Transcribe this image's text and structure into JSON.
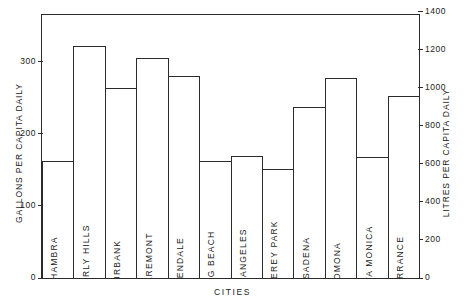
{
  "chart_data": {
    "type": "bar",
    "title": "",
    "xlabel": "CITIES",
    "ylabel": "GALLONS PER CAPITA DAILY",
    "ylabel_right": "LITRES PER CAPITA DAILY",
    "categories": [
      "ALHAMBRA",
      "BEVERLY HILLS",
      "BURBANK",
      "CLAREMONT",
      "GLENDALE",
      "LONG BEACH",
      "LOS ANGELES",
      "MONTEREY PARK",
      "PASADENA",
      "POMONA",
      "SANTA MONICA",
      "TORRANCE"
    ],
    "values": [
      162,
      322,
      264,
      305,
      281,
      162,
      169,
      151,
      238,
      278,
      168,
      252
    ],
    "values_litres": [
      613,
      1219,
      999,
      1154,
      1064,
      613,
      640,
      572,
      901,
      1052,
      636,
      954
    ],
    "ylim": [
      0,
      365
    ],
    "ylim_right": [
      0,
      1382
    ],
    "yticks": [
      0,
      100,
      200,
      300
    ],
    "yticklabels": [
      "0",
      "100",
      "200",
      "300"
    ],
    "yticks_right": [
      0,
      200,
      400,
      600,
      800,
      1000,
      1200,
      1400
    ],
    "yticklabels_right": [
      "0",
      "200",
      "400",
      "600",
      "800",
      "1000",
      "1200",
      "1400"
    ],
    "grid": false,
    "legend": null,
    "bar_color": "#ffffff",
    "bar_edge_color": "#2b2b2b"
  }
}
